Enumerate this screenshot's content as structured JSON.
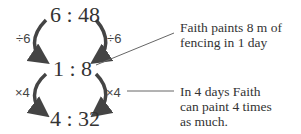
{
  "ratios": {
    "top": "6 : 48",
    "middle": "1 : 8",
    "bottom": "4 : 32"
  },
  "operations": {
    "top_left": "÷6",
    "top_right": "÷6",
    "bottom_left": "×4",
    "bottom_right": "×4"
  },
  "notes": {
    "first_line1": "Faith paints 8 m of",
    "first_line2": "fencing in 1 day",
    "second_line1": "In 4 days Faith",
    "second_line2": "can paint 4 times",
    "second_line3": "as much."
  }
}
